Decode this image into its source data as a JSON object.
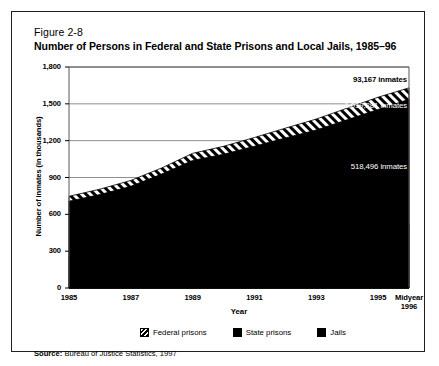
{
  "figure": {
    "number": "Figure 2-8",
    "title": "Number of Persons in Federal and State Prisons and Local Jails, 1985–96",
    "source_label": "Source:",
    "source_text": "Bureau of Justice Statistics, 1997"
  },
  "legend": {
    "items": [
      {
        "label": "Federal prisons",
        "swatch": "hatch",
        "color": "#000000"
      },
      {
        "label": "State prisons",
        "swatch": "solid",
        "color": "#000000"
      },
      {
        "label": "Jails",
        "swatch": "solid",
        "color": "#000000"
      }
    ]
  },
  "chart_data": {
    "type": "area",
    "stacked": true,
    "title": "Number of Persons in Federal and State Prisons and Local Jails, 1985–96",
    "xlabel": "Year",
    "ylabel": "Number of inmates (in thousands)",
    "ylim": [
      0,
      1800
    ],
    "yticks": [
      "0",
      "300",
      "600",
      "900",
      "1,200",
      "1,500",
      "1,800"
    ],
    "ytick_values": [
      0,
      300,
      600,
      900,
      1200,
      1500,
      1800
    ],
    "xticks": [
      "1985",
      "1987",
      "1989",
      "1991",
      "1993",
      "1995",
      "Midyear 1996"
    ],
    "xtick_lines": [
      [
        "1985"
      ],
      [
        "1987"
      ],
      [
        "1989"
      ],
      [
        "1991"
      ],
      [
        "1993"
      ],
      [
        "1995"
      ],
      [
        "Midyear",
        "1996"
      ]
    ],
    "x": [
      1985,
      1986,
      1987,
      1988,
      1989,
      1990,
      1991,
      1992,
      1993,
      1994,
      1995,
      1996
    ],
    "grid": true,
    "grid_axis": "y",
    "legend_position": "bottom",
    "series": [
      {
        "name": "Jails",
        "fill": "solid",
        "color": "#000000",
        "values": [
          256,
          274,
          295,
          343,
          395,
          405,
          426,
          444,
          459,
          486,
          507,
          518
        ]
      },
      {
        "name": "State prisons",
        "fill": "solid",
        "color": "#000000",
        "values": [
          451,
          487,
          533,
          585,
          644,
          684,
          729,
          778,
          828,
          884,
          947,
          1019
        ]
      },
      {
        "name": "Federal prisons",
        "fill": "hatch",
        "color": "#000000",
        "values": [
          40,
          44,
          48,
          50,
          58,
          65,
          71,
          80,
          89,
          95,
          100,
          93
        ]
      }
    ],
    "annotations": [
      {
        "id": "federal",
        "text": "93,167 inmates",
        "series": "Federal prisons",
        "value": 93167,
        "on_dark": false
      },
      {
        "id": "state",
        "text": "1,019,281 inmates",
        "series": "State prisons",
        "value": 1019281,
        "on_dark": true
      },
      {
        "id": "jails",
        "text": "518,496 inmates",
        "series": "Jails",
        "value": 518496,
        "on_dark": true
      }
    ]
  }
}
